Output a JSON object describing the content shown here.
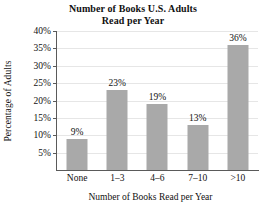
{
  "chart_data": {
    "type": "bar",
    "title": "Number of Books U.S. Adults Read per Year",
    "title_lines": [
      "Number of Books U.S. Adults",
      "Read per Year"
    ],
    "xlabel": "Number of Books Read per Year",
    "ylabel": "Percentage of Adults",
    "categories": [
      "None",
      "1–3",
      "4–6",
      "7–10",
      ">10"
    ],
    "values": [
      9,
      23,
      19,
      13,
      36
    ],
    "value_labels": [
      "9%",
      "23%",
      "19%",
      "13%",
      "36%"
    ],
    "ylim": [
      0,
      40
    ],
    "ytick_values": [
      5,
      10,
      15,
      20,
      25,
      30,
      35,
      40
    ],
    "ytick_labels": [
      "5%",
      "10%",
      "15%",
      "20%",
      "25%",
      "30%",
      "35%",
      "40%"
    ],
    "grid": true,
    "legend": "none",
    "bar_color": "#a9a9a9",
    "axis_color": "#5a5a5a",
    "gridline_color": "#e6e6e6",
    "background_color": "#ffffff"
  }
}
